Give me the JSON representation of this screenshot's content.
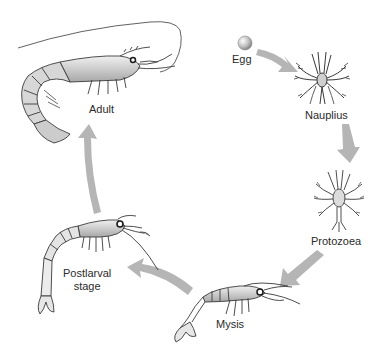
{
  "diagram": {
    "stages": [
      {
        "id": "egg",
        "label": "Egg"
      },
      {
        "id": "nauplius",
        "label": "Nauplius"
      },
      {
        "id": "protozoea",
        "label": "Protozoea"
      },
      {
        "id": "mysis",
        "label": "Mysis"
      },
      {
        "id": "postlarval",
        "label": "Postlarval\nstage",
        "label_line1": "Postlarval",
        "label_line2": "stage"
      },
      {
        "id": "adult",
        "label": "Adult"
      }
    ],
    "arrows": [
      {
        "from": "egg",
        "to": "nauplius"
      },
      {
        "from": "nauplius",
        "to": "protozoea"
      },
      {
        "from": "protozoea",
        "to": "mysis"
      },
      {
        "from": "mysis",
        "to": "postlarval"
      },
      {
        "from": "postlarval",
        "to": "adult"
      }
    ],
    "colors": {
      "arrow": "#b5b5b5",
      "outline": "#3a3a3a",
      "body_fill": "#d9d9d9",
      "shade": "#9a9a9a",
      "text": "#2b2b2b",
      "background": "#ffffff"
    }
  }
}
